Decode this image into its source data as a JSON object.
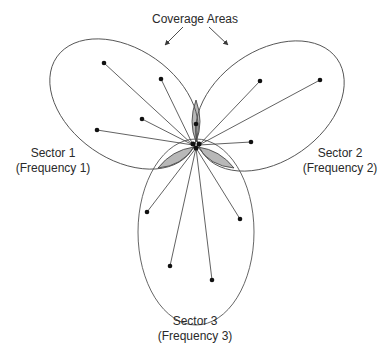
{
  "title": "Coverage Areas",
  "sectors": [
    {
      "name": "Sector 1",
      "frequency": "(Frequency 1)"
    },
    {
      "name": "Sector 2",
      "frequency": "(Frequency 2)"
    },
    {
      "name": "Sector 3",
      "frequency": "(Frequency 3)"
    }
  ],
  "colors": {
    "line": "#3a3a3a",
    "overlap_fill": "#b8b8b8",
    "dot": "#111111",
    "background": "#ffffff"
  },
  "base_station": {
    "x": 196,
    "y": 145
  },
  "ellipses": [
    {
      "cx": 124,
      "cy": 104,
      "rx": 82,
      "ry": 55,
      "rotate": 35
    },
    {
      "cx": 270,
      "cy": 106,
      "rx": 82,
      "ry": 55,
      "rotate": -35
    },
    {
      "cx": 196,
      "cy": 232,
      "rx": 58,
      "ry": 93,
      "rotate": 0
    }
  ],
  "users": [
    {
      "sector": 1,
      "x": 104,
      "y": 63
    },
    {
      "sector": 1,
      "x": 161,
      "y": 79
    },
    {
      "sector": 1,
      "x": 142,
      "y": 119
    },
    {
      "sector": 1,
      "x": 97,
      "y": 130
    },
    {
      "sector": 2,
      "x": 260,
      "y": 81
    },
    {
      "sector": 2,
      "x": 320,
      "y": 80
    },
    {
      "sector": 2,
      "x": 251,
      "y": 142
    },
    {
      "sector": 3,
      "x": 147,
      "y": 212
    },
    {
      "sector": 3,
      "x": 240,
      "y": 219
    },
    {
      "sector": 3,
      "x": 170,
      "y": 266
    },
    {
      "sector": 3,
      "x": 212,
      "y": 280
    },
    {
      "sector": 0,
      "x": 196,
      "y": 124
    }
  ]
}
